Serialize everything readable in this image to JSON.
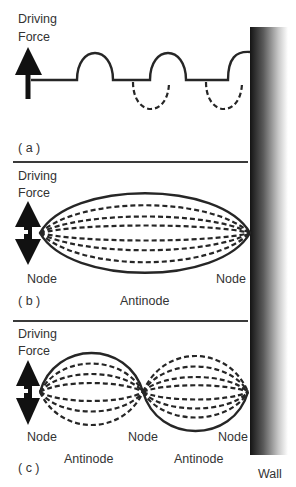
{
  "figure": {
    "colors": {
      "ink": "#262626",
      "text": "#333333",
      "wall_dark": "#1a1a1a",
      "wall_light": "#ffffff",
      "background": "#ffffff"
    },
    "wall": {
      "label": "Wall"
    },
    "panels": [
      {
        "id": "a",
        "tag": "( a )",
        "driving_force_line1": "Driving",
        "driving_force_line2": "Force",
        "arrow": "up-arrow",
        "description": "Travelling pulses: solid pulses above line, dashed reflected pulses below"
      },
      {
        "id": "b",
        "tag": "( b )",
        "driving_force_line1": "Driving",
        "driving_force_line2": "Force",
        "arrow": "up-down-arrow",
        "node_left": "Node",
        "node_right": "Node",
        "antinode": "Antinode",
        "description": "Fundamental mode: one loop between two nodes"
      },
      {
        "id": "c",
        "tag": "( c )",
        "driving_force_line1": "Driving",
        "driving_force_line2": "Force",
        "arrow": "up-down-arrow",
        "node_left": "Node",
        "node_middle": "Node",
        "node_right": "Node",
        "antinode_1": "Antinode",
        "antinode_2": "Antinode",
        "description": "Second harmonic: two loops, three nodes"
      }
    ]
  }
}
